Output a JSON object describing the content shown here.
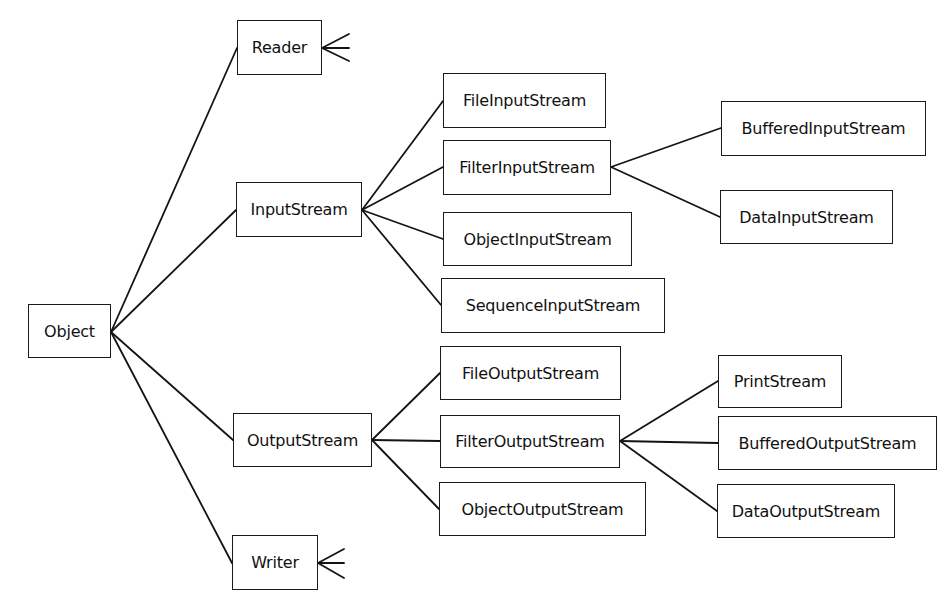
{
  "diagram": {
    "type": "class-hierarchy-tree",
    "nodes": {
      "object": {
        "label": "Object"
      },
      "reader": {
        "label": "Reader"
      },
      "input_stream": {
        "label": "InputStream"
      },
      "output_stream": {
        "label": "OutputStream"
      },
      "writer": {
        "label": "Writer"
      },
      "file_input_stream": {
        "label": "FileInputStream"
      },
      "filter_input_stream": {
        "label": "FilterInputStream"
      },
      "object_input_stream": {
        "label": "ObjectInputStream"
      },
      "sequence_input_stream": {
        "label": "SequenceInputStream"
      },
      "buffered_input_stream": {
        "label": "BufferedInputStream"
      },
      "data_input_stream": {
        "label": "DataInputStream"
      },
      "file_output_stream": {
        "label": "FileOutputStream"
      },
      "filter_output_stream": {
        "label": "FilterOutputStream"
      },
      "object_output_stream": {
        "label": "ObjectOutputStream"
      },
      "print_stream": {
        "label": "PrintStream"
      },
      "buffered_output_stream": {
        "label": "BufferedOutputStream"
      },
      "data_output_stream": {
        "label": "DataOutputStream"
      }
    },
    "edges": [
      [
        "object",
        "reader"
      ],
      [
        "object",
        "input_stream"
      ],
      [
        "object",
        "output_stream"
      ],
      [
        "object",
        "writer"
      ],
      [
        "input_stream",
        "file_input_stream"
      ],
      [
        "input_stream",
        "filter_input_stream"
      ],
      [
        "input_stream",
        "object_input_stream"
      ],
      [
        "input_stream",
        "sequence_input_stream"
      ],
      [
        "filter_input_stream",
        "buffered_input_stream"
      ],
      [
        "filter_input_stream",
        "data_input_stream"
      ],
      [
        "output_stream",
        "file_output_stream"
      ],
      [
        "output_stream",
        "filter_output_stream"
      ],
      [
        "output_stream",
        "object_output_stream"
      ],
      [
        "filter_output_stream",
        "print_stream"
      ],
      [
        "filter_output_stream",
        "buffered_output_stream"
      ],
      [
        "filter_output_stream",
        "data_output_stream"
      ]
    ],
    "collapsed_subtrees": [
      "reader",
      "writer"
    ],
    "colors": {
      "stroke": "#141414",
      "text": "#111111",
      "background": "#ffffff"
    }
  }
}
